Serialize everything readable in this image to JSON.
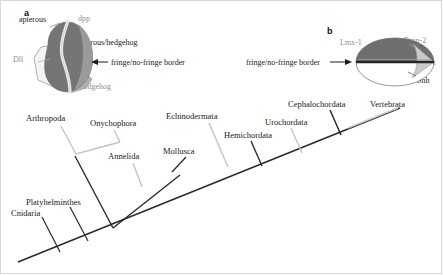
{
  "figure": {
    "background_color": "#ffffff"
  },
  "panel_a": {
    "letter": "a",
    "subject": "drosophila-wing-disc",
    "labels": {
      "apterous": "apterous",
      "dpp": "dpp",
      "apterous_hedgehog": "apterous/hedgehog",
      "dll": "Dll",
      "hedgehog": "hedgehog",
      "border": "fringe/no-fringe border"
    },
    "arrow_direction": "left",
    "colors": {
      "dark_region": "#6b6b6b",
      "mid_region": "#8d8d8d",
      "light_band": "#e6e6e6",
      "pale_region": "#f2f2f2",
      "outline": "#8a8a8a",
      "label_gray": "#8f8f8f",
      "label_black": "#1a1a1a"
    }
  },
  "panel_b": {
    "letter": "b",
    "subject": "vertebrate-limb-bud",
    "labels": {
      "lmx1": "Lmx-1",
      "bmp2": "Bmp-2",
      "dlx": "Dlx",
      "shh": "Shh",
      "border": "fringe/no-fringe border"
    },
    "arrow_direction": "right",
    "colors": {
      "dorsal": "#6e6e6e",
      "ventral": "#ffffff",
      "wedge": "#c9c9c9",
      "aer_line": "#2b2b2b",
      "outline": "#7a7a7a",
      "label_gray": "#8f8f8f",
      "label_black": "#1a1a1a"
    }
  },
  "tree": {
    "type": "cladogram",
    "orientation": "diagonal-ascending-left-to-right",
    "colors": {
      "dark_branch": "#2b2b2b",
      "light_branch": "#c4c4c4"
    },
    "taxa": [
      {
        "name": "Cnidaria",
        "branch_shade": "dark",
        "label_x": 11,
        "label_y": 208,
        "tip_x": 38,
        "tip_y": 218,
        "base_x": 60,
        "base_y": 250
      },
      {
        "name": "Platyhelminthes",
        "branch_shade": "dark",
        "label_x": 26,
        "label_y": 197,
        "tip_x": 68,
        "tip_y": 208,
        "base_x": 89,
        "base_y": 240
      },
      {
        "name": "Arthropoda",
        "branch_shade": "light",
        "label_x": 26,
        "label_y": 113,
        "tip_x": 58,
        "tip_y": 124,
        "base_x": 80,
        "base_y": 156
      },
      {
        "name": "Onychophora",
        "branch_shade": "light",
        "label_x": 90,
        "label_y": 118,
        "tip_x": 115,
        "tip_y": 129,
        "base_x": 95,
        "base_y": 145
      },
      {
        "name": "Annelida",
        "branch_shade": "light",
        "label_x": 108,
        "label_y": 151,
        "tip_x": 133,
        "tip_y": 162,
        "base_x": 143,
        "base_y": 186
      },
      {
        "name": "Mollusca",
        "branch_shade": "dark",
        "label_x": 163,
        "label_y": 146,
        "tip_x": 184,
        "tip_y": 157,
        "base_x": 168,
        "base_y": 175
      },
      {
        "name": "Echinodermata",
        "branch_shade": "light",
        "label_x": 166,
        "label_y": 111,
        "tip_x": 208,
        "tip_y": 122,
        "base_x": 225,
        "base_y": 166
      },
      {
        "name": "Hemichordata",
        "branch_shade": "dark",
        "label_x": 224,
        "label_y": 130,
        "tip_x": 252,
        "tip_y": 141,
        "base_x": 262,
        "base_y": 165
      },
      {
        "name": "Urochordata",
        "branch_shade": "light",
        "label_x": 265,
        "label_y": 117,
        "tip_x": 290,
        "tip_y": 128,
        "base_x": 300,
        "base_y": 152
      },
      {
        "name": "Cephalochordata",
        "branch_shade": "dark",
        "label_x": 288,
        "label_y": 99,
        "tip_x": 328,
        "tip_y": 110,
        "base_x": 339,
        "base_y": 134
      },
      {
        "name": "Vertebrata",
        "branch_shade": "light",
        "label_x": 370,
        "label_y": 99,
        "tip_x": 395,
        "tip_y": 110,
        "base_x": 355,
        "base_y": 131
      }
    ],
    "backbone": {
      "start_x": 18,
      "start_y": 262,
      "end_x": 400,
      "end_y": 108
    }
  }
}
